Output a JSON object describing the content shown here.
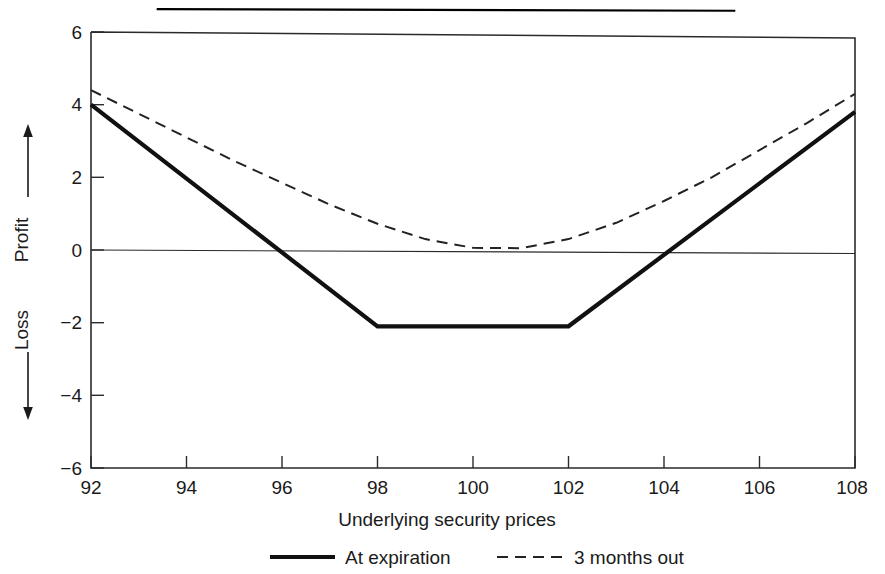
{
  "figure": {
    "rule_label": "top-rule"
  },
  "chart_data": {
    "type": "line",
    "title": "",
    "xlabel": "Underlying security prices",
    "ylabel": "← Loss      Profit →",
    "ylabel_profit": "Profit",
    "ylabel_loss": "Loss",
    "xlim": [
      92,
      108
    ],
    "ylim": [
      -6,
      6
    ],
    "xticks": [
      92,
      94,
      96,
      98,
      100,
      102,
      104,
      106,
      108
    ],
    "xticklabels": [
      "92",
      "94",
      "96",
      "98",
      "100",
      "102",
      "104",
      "106",
      "108"
    ],
    "yticks": [
      -6,
      -4,
      -2,
      0,
      2,
      4,
      6
    ],
    "yticklabels": [
      "−6",
      "−4",
      "−2",
      "0",
      "2",
      "4",
      "6"
    ],
    "grid": false,
    "zero_line": true,
    "legend_position": "below-axis",
    "series": [
      {
        "name": "At expiration",
        "style": "solid",
        "color": "#111111",
        "x": [
          92,
          98,
          102,
          108
        ],
        "y": [
          4.0,
          -2.1,
          -2.1,
          3.8
        ]
      },
      {
        "name": "3 months out",
        "style": "dashed",
        "color": "#222222",
        "x": [
          92,
          93,
          94,
          95,
          96,
          97,
          98,
          99,
          100,
          101,
          102,
          103,
          104,
          105,
          106,
          107,
          108
        ],
        "y": [
          4.4,
          3.75,
          3.1,
          2.45,
          1.85,
          1.25,
          0.72,
          0.3,
          0.06,
          0.05,
          0.3,
          0.75,
          1.35,
          2.0,
          2.75,
          3.5,
          4.3
        ]
      }
    ]
  },
  "legend": {
    "entries": [
      {
        "label": "At expiration",
        "style": "solid"
      },
      {
        "label": "3 months out",
        "style": "dashed"
      }
    ]
  }
}
